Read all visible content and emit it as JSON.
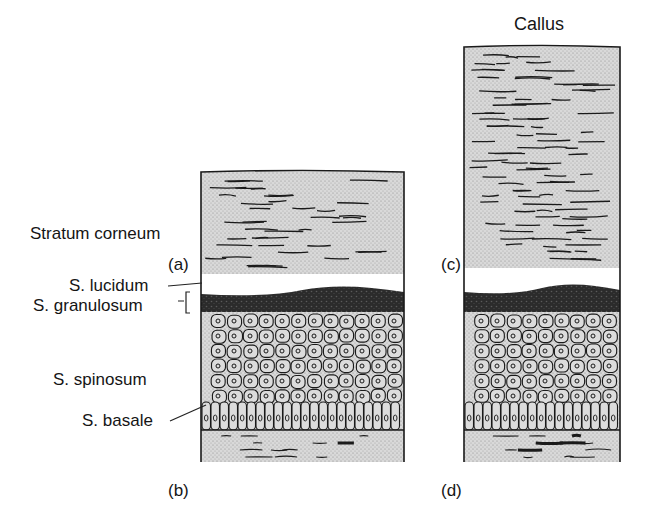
{
  "title": "Callus",
  "layers": {
    "corneum": "Stratum corneum",
    "lucidum": "S. lucidum",
    "granulosum": "S. granulosum",
    "spinosum": "S. spinosum",
    "basale": "S. basale"
  },
  "panel_labels": {
    "a": "(a)",
    "b": "(b)",
    "c": "(c)",
    "d": "(d)"
  },
  "colors": {
    "stipple": "#cfcfcf",
    "stipple_dark": "#bdbdbd",
    "ink": "#1a1a1a",
    "granular": "#2a2a2a",
    "background": "#ffffff"
  },
  "panels": [
    {
      "id": "normal",
      "x": 201,
      "w": 203,
      "top": 172,
      "lucid_top": 274,
      "gran_top": 292,
      "cell_top": 312,
      "derm_top": 430,
      "bottom": 462
    },
    {
      "id": "callus",
      "x": 464,
      "w": 156,
      "top": 47,
      "lucid_top": 268,
      "gran_top": 290,
      "cell_top": 312,
      "derm_top": 430,
      "bottom": 462
    }
  ]
}
